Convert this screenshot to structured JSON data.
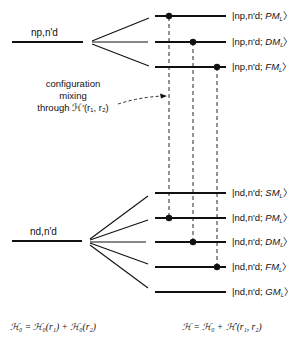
{
  "diagram": {
    "left_levels": {
      "upper": {
        "label": "np,n'd"
      },
      "lower": {
        "label": "nd,n'd"
      }
    },
    "annotation": {
      "line1": "configuration",
      "line2": "mixing",
      "line3": "through ℋ′(r₁, r₂)"
    },
    "upper_states": [
      {
        "prefix": "|np,n'd; ",
        "term": "PM",
        "sub": "L",
        "suffix": "〉",
        "dot": true
      },
      {
        "prefix": "|np,n'd; ",
        "term": "DM",
        "sub": "L",
        "suffix": "〉",
        "dot": true
      },
      {
        "prefix": "|np,n'd; ",
        "term": "FM",
        "sub": "L",
        "suffix": "〉",
        "dot": true
      }
    ],
    "lower_states": [
      {
        "prefix": "|nd,n'd; ",
        "term": "SM",
        "sub": "L",
        "suffix": "〉",
        "dot": false
      },
      {
        "prefix": "|nd,n'd; ",
        "term": "PM",
        "sub": "L",
        "suffix": "〉",
        "dot": true
      },
      {
        "prefix": "|nd,n'd; ",
        "term": "DM",
        "sub": "L",
        "suffix": "〉",
        "dot": true
      },
      {
        "prefix": "|nd,n'd; ",
        "term": "FM",
        "sub": "L",
        "suffix": "〉",
        "dot": true
      },
      {
        "prefix": "|nd,n'd; ",
        "term": "GM",
        "sub": "L",
        "suffix": "〉",
        "dot": false
      }
    ],
    "formulas": {
      "left": "ℋ₀ = ℋ₀(r₁) + ℋ₀(r₂)",
      "right": "ℋ = ℋ₀ + ℋ′(r₁, r₂)"
    },
    "colors": {
      "ink": "#111111",
      "background": "#ffffff"
    }
  }
}
